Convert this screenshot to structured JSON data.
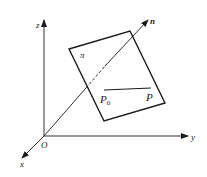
{
  "diagram": {
    "type": "3d-coordinate-plane-normal",
    "axes": {
      "x_label": "x",
      "y_label": "y",
      "z_label": "z",
      "origin_label": "O"
    },
    "plane_label": "π",
    "normal_label": "n",
    "points": {
      "p0_label": "P",
      "p0_sub": "0",
      "p_label": "P"
    },
    "colors": {
      "stroke": "#1a1a1a",
      "background": "#ffffff"
    }
  }
}
